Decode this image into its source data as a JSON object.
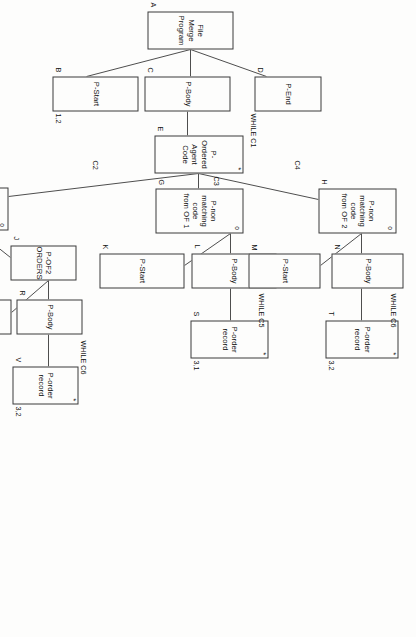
{
  "diagram": {
    "type": "jackson-structured-program-structure-chart",
    "title": "File Merge Program",
    "orientation": "rotated-90-clockwise",
    "nodes": [
      {
        "id": "A",
        "label": "File\nMerge\nProgram",
        "tag": "A",
        "mark": "",
        "note": "",
        "x": 11,
        "y": 183,
        "w": 38,
        "h": 86
      },
      {
        "id": "B",
        "label": "P-Start",
        "tag": "B",
        "mark": "",
        "note": "1,2",
        "x": 76,
        "y": 278,
        "w": 35,
        "h": 86
      },
      {
        "id": "C",
        "label": "P-Body",
        "tag": "C",
        "mark": "",
        "note": "",
        "x": 76,
        "y": 186,
        "w": 35,
        "h": 86
      },
      {
        "id": "D",
        "label": "P-End",
        "tag": "D",
        "mark": "",
        "note": "",
        "x": 76,
        "y": 95,
        "w": 35,
        "h": 67
      },
      {
        "id": "E",
        "label": "P-Ordered\nAgent Code",
        "tag": "E",
        "mark": "*",
        "note": "",
        "x": 135,
        "y": 173,
        "w": 38,
        "h": 89
      },
      {
        "id": "G",
        "label": "P-non\nmatching code\nfrom OF 1",
        "tag": "G",
        "mark": "o",
        "note": "",
        "x": 188,
        "y": 173,
        "w": 45,
        "h": 88
      },
      {
        "id": "H",
        "label": "P-non\nmatching code\nfrom OF 2",
        "tag": "H",
        "mark": "o",
        "note": "",
        "x": 188,
        "y": 20,
        "w": 45,
        "h": 78
      },
      {
        "id": "K",
        "label": "P-Start",
        "tag": "K",
        "mark": "",
        "note": "",
        "x": 253,
        "y": 232,
        "w": 35,
        "h": 85
      },
      {
        "id": "L",
        "label": "P-Body",
        "tag": "L",
        "mark": "",
        "note": "",
        "x": 253,
        "y": 140,
        "w": 35,
        "h": 85
      },
      {
        "id": "M",
        "label": "P-Start",
        "tag": "M",
        "mark": "",
        "note": "",
        "x": 253,
        "y": 96,
        "w": 35,
        "h": 72
      },
      {
        "id": "N",
        "label": "P-Body",
        "tag": "N",
        "mark": "",
        "note": "",
        "x": 253,
        "y": 13,
        "w": 35,
        "h": 72
      },
      {
        "id": "S",
        "label": "P-order\nrecord",
        "tag": "S",
        "mark": "*",
        "note": "3,1",
        "x": 320,
        "y": 148,
        "w": 38,
        "h": 78
      },
      {
        "id": "T",
        "label": "P-order\nrecord",
        "tag": "T",
        "mark": "*",
        "note": "3,2",
        "x": 320,
        "y": 18,
        "w": 38,
        "h": 73
      },
      {
        "id": "F",
        "label": "P-matching\nagent code",
        "tag": "F",
        "mark": "o",
        "note": "",
        "x": 187,
        "y": 408,
        "w": 43,
        "h": 60
      },
      {
        "id": "I",
        "label": "P-OF1\nORDERS",
        "tag": "I",
        "mark": "",
        "note": "",
        "x": 245,
        "y": 500,
        "w": 35,
        "h": 66
      },
      {
        "id": "J",
        "label": "P-OF2\nORDERS",
        "tag": "J",
        "mark": "",
        "note": "",
        "x": 245,
        "y": 340,
        "w": 35,
        "h": 66
      },
      {
        "id": "O1",
        "label": "P-Start",
        "tag": "O",
        "mark": "",
        "note": "",
        "x": 299,
        "y": 562,
        "w": 35,
        "h": 68
      },
      {
        "id": "P",
        "label": "P-Body",
        "tag": "P",
        "mark": "",
        "note": "",
        "x": 299,
        "y": 494,
        "w": 35,
        "h": 62
      },
      {
        "id": "O2",
        "label": "P-Start",
        "tag": "O",
        "mark": "",
        "note": "",
        "x": 299,
        "y": 405,
        "w": 35,
        "h": 68
      },
      {
        "id": "R",
        "label": "P-Body",
        "tag": "R",
        "mark": "",
        "note": "",
        "x": 299,
        "y": 334,
        "w": 35,
        "h": 66
      },
      {
        "id": "U",
        "label": "P-order\nrecord",
        "tag": "U",
        "mark": "*",
        "note": "3,1",
        "x": 366,
        "y": 498,
        "w": 38,
        "h": 66
      },
      {
        "id": "V",
        "label": "P-order\nrecord",
        "tag": "V",
        "mark": "*",
        "note": "3,2",
        "x": 366,
        "y": 338,
        "w": 38,
        "h": 66
      }
    ],
    "conditions": [
      {
        "id": "c1",
        "text": "WHILE C1",
        "x": 113,
        "y": 160
      },
      {
        "id": "c2",
        "text": "C2",
        "x": 160,
        "y": 318
      },
      {
        "id": "c3",
        "text": "C3",
        "x": 176,
        "y": 197
      },
      {
        "id": "c4",
        "text": "C4",
        "x": 160,
        "y": 116
      },
      {
        "id": "c5a",
        "text": "WHILE C5",
        "x": 293,
        "y": 152
      },
      {
        "id": "c6a",
        "text": "WHILE C6",
        "x": 293,
        "y": 20
      },
      {
        "id": "c5b",
        "text": "WHILE C5",
        "x": 340,
        "y": 490
      },
      {
        "id": "c6b",
        "text": "WHILE C6",
        "x": 340,
        "y": 330
      }
    ],
    "legend": {
      "iteration_marker": "*",
      "selection_marker": "o",
      "marker_meaning_iteration": "iteration (WHILE)",
      "marker_meaning_selection": "selection (OR)"
    }
  }
}
